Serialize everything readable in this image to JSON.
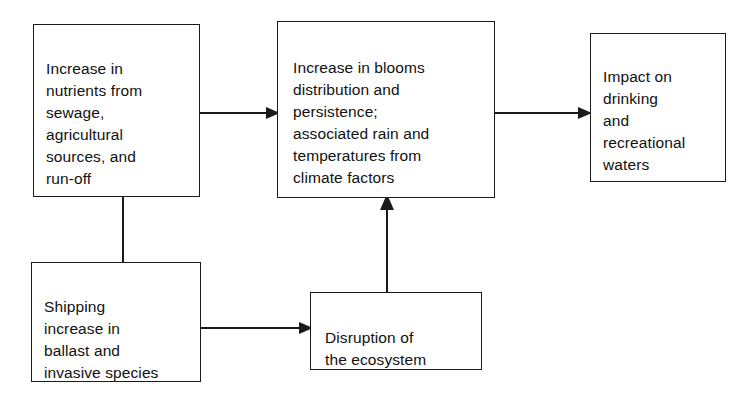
{
  "diagram": {
    "type": "flowchart",
    "background_color": "#ffffff",
    "line_color": "#1b1b1b",
    "text_color": "#111111",
    "nodes": [
      {
        "id": "nutrients",
        "label": "Increase in\nnutrients from\nsewage,\nagricultural\nsources, and\nrun-off",
        "shape": "rectangle"
      },
      {
        "id": "blooms",
        "label": "Increase in blooms\ndistribution and\npersistence;\nassociated rain and\ntemperatures from\nclimate factors",
        "shape": "rectangle"
      },
      {
        "id": "impact",
        "label": "Impact on\ndrinking\nand\nrecreational\nwaters",
        "shape": "rectangle"
      },
      {
        "id": "shipping",
        "label": "Shipping\nincrease in\nballast and\ninvasive species",
        "shape": "rectangle"
      },
      {
        "id": "disruption",
        "label": "Disruption of\nthe ecosystem",
        "shape": "rectangle"
      }
    ],
    "edges": [
      {
        "id": "nutrients-blooms",
        "from": "nutrients",
        "to": "blooms",
        "direction": "right",
        "arrowhead": true,
        "label": ""
      },
      {
        "id": "blooms-impact",
        "from": "blooms",
        "to": "impact",
        "direction": "right",
        "arrowhead": true,
        "label": ""
      },
      {
        "id": "nutrients-shipping",
        "from": "nutrients",
        "to": "shipping",
        "direction": "down",
        "arrowhead": false,
        "label": ""
      },
      {
        "id": "shipping-disruption",
        "from": "shipping",
        "to": "disruption",
        "direction": "right",
        "arrowhead": true,
        "label": ""
      },
      {
        "id": "disruption-blooms",
        "from": "disruption",
        "to": "blooms",
        "direction": "up",
        "arrowhead": true,
        "label": ""
      }
    ]
  }
}
